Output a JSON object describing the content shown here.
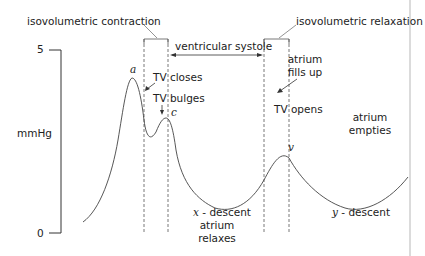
{
  "diagram": {
    "y_axis": {
      "unit_label": "mmHg",
      "max_tick": "5",
      "min_tick": "0"
    },
    "phases": {
      "isovolumetric_contraction": "isovolumetric contraction",
      "isovolumetric_relaxation": "isovolumetric relaxation",
      "ventricular_systole": "ventricular systole"
    },
    "waves": {
      "a": "a",
      "c": "c",
      "v": "v",
      "x": "x",
      "y": "y"
    },
    "annotations": {
      "tv_closes": "TV closes",
      "tv_bulges": "TV bulges",
      "tv_opens": "TV opens",
      "atrium_fills_up_1": "atrium",
      "atrium_fills_up_2": "fills up",
      "atrium_empties_1": "atrium",
      "atrium_empties_2": "empties",
      "x_descent_suffix": " - descent",
      "atrium_relaxes_1": "atrium",
      "atrium_relaxes_2": "relaxes",
      "y_descent_suffix": " - descent"
    },
    "colors": {
      "line": "#444444",
      "axis": "#333333",
      "border": "#cccccc",
      "background": "#ffffff"
    }
  }
}
